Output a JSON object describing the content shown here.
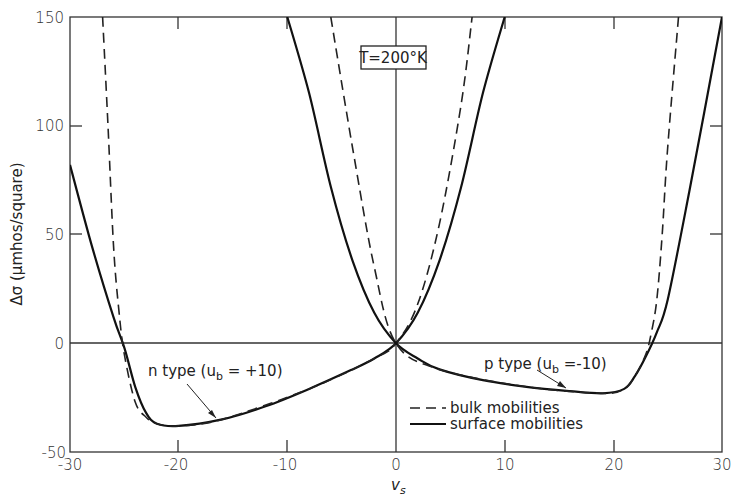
{
  "chart_data": {
    "type": "line",
    "title": "",
    "xlabel": "v_s",
    "ylabel": "Δσ (μmhos/square)",
    "xlim": [
      -30,
      30
    ],
    "ylim": [
      -50,
      150
    ],
    "xticks": [
      -30,
      -20,
      -10,
      0,
      10,
      20,
      30
    ],
    "yticks": [
      -50,
      0,
      50,
      100,
      150
    ],
    "grid": false,
    "annotations": {
      "temperature_box": "T=200°K",
      "n_type_label": "n type (u_b = +10)",
      "p_type_label": "p type (u_b = -10)"
    },
    "legend": {
      "position": "lower right",
      "entries": [
        {
          "label": "bulk mobilities",
          "style": "dashed"
        },
        {
          "label": "surface mobilities",
          "style": "solid"
        }
      ]
    },
    "series": [
      {
        "name": "n type surface mobilities",
        "style": "solid",
        "x": [
          -30,
          -28,
          -26,
          -25,
          -24,
          -23,
          -22,
          -20,
          -16,
          -12,
          -8,
          -4,
          -2,
          0,
          2,
          4,
          6,
          8,
          10
        ],
        "y": [
          82,
          45,
          12,
          -2,
          -20,
          -32,
          -37,
          -38,
          -35,
          -29,
          -21,
          -12,
          -7,
          0,
          14,
          38,
          72,
          115,
          150
        ]
      },
      {
        "name": "n type bulk mobilities",
        "style": "dashed",
        "x": [
          -27,
          -26.5,
          -26,
          -25.5,
          -25,
          -24,
          -23,
          -22,
          -20,
          -16,
          -8,
          -2,
          0,
          2,
          4,
          6,
          7
        ],
        "y": [
          150,
          100,
          45,
          15,
          -5,
          -27,
          -34,
          -37,
          -38,
          -35,
          -21,
          -7,
          0,
          18,
          55,
          110,
          150
        ]
      },
      {
        "name": "p type surface mobilities",
        "style": "solid",
        "x": [
          -10,
          -8,
          -6,
          -4,
          -2,
          0,
          2,
          4,
          8,
          12,
          16,
          19,
          21,
          22,
          23,
          24,
          25,
          27,
          30
        ],
        "y": [
          150,
          115,
          72,
          38,
          14,
          0,
          -7,
          -12,
          -17,
          -20,
          -22,
          -23,
          -21,
          -15,
          -6,
          5,
          20,
          70,
          150
        ]
      },
      {
        "name": "p type bulk mobilities",
        "style": "dashed",
        "x": [
          -6,
          -4,
          -2,
          0,
          4,
          12,
          19,
          21,
          22,
          23,
          23.5,
          24,
          24.5,
          25,
          26
        ],
        "y": [
          150,
          90,
          35,
          0,
          -12,
          -20,
          -23,
          -21,
          -15,
          -5,
          5,
          20,
          50,
          90,
          150
        ]
      }
    ]
  },
  "labels": {
    "y_axis_title": "Δσ (μmhos/square)",
    "x_axis_title": "v",
    "x_axis_sub": "s",
    "temp_box": "T=200°K",
    "n_type_prefix": "n type (u",
    "n_type_sub": "b",
    "n_type_suffix": " = +10)",
    "p_type_prefix": "p type (u",
    "p_type_sub": "b",
    "p_type_suffix": " =-10)",
    "legend_bulk": "bulk mobilities",
    "legend_surface": "surface mobilities",
    "yticks": [
      "150",
      "100",
      "50",
      "0",
      "-50"
    ],
    "xticks": [
      "-30",
      "-20",
      "-10",
      "0",
      "10",
      "20",
      "30"
    ]
  }
}
